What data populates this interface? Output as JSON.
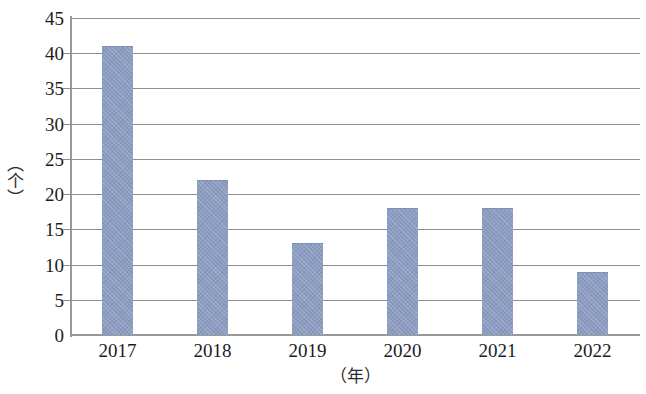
{
  "chart_data": {
    "type": "bar",
    "title": "",
    "subtitle": "",
    "categories": [
      "2017",
      "2018",
      "2019",
      "2020",
      "2021",
      "2022"
    ],
    "values": [
      41,
      22,
      13,
      18,
      18,
      9
    ],
    "xlabel": "（年）",
    "ylabel": "（个）",
    "ylim": [
      0,
      45
    ],
    "ytick_labels": [
      "45",
      "40",
      "35",
      "30",
      "25",
      "20",
      "15",
      "10",
      "5",
      "0"
    ],
    "ytick_values": [
      45,
      40,
      35,
      30,
      25,
      20,
      15,
      10,
      5,
      0
    ],
    "ytick_step": 5,
    "grid": "horizontal",
    "legend": "none",
    "bar_color": "#8b9cc1",
    "gridline_color": "#8d8d8d",
    "axis_color": "#9a9a9a",
    "background_color": "#ffffff",
    "series": [
      {
        "name": "",
        "values": [
          41,
          22,
          13,
          18,
          18,
          9
        ]
      }
    ]
  }
}
